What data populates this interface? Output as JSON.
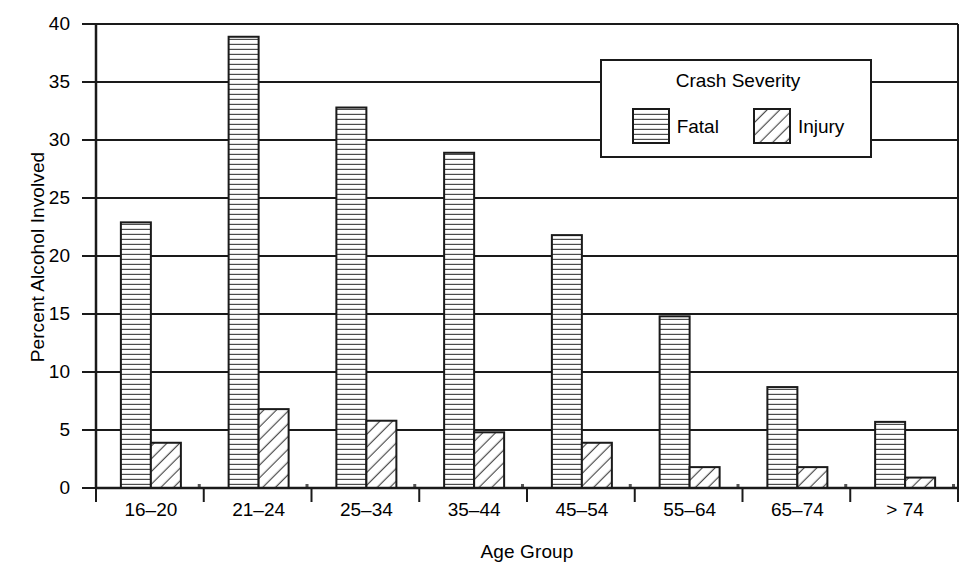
{
  "chart_data": {
    "type": "bar",
    "title": "",
    "xlabel": "Age Group",
    "ylabel": "Percent Alcohol Involved",
    "categories": [
      "16–20",
      "21–24",
      "25–34",
      "35–44",
      "45–54",
      "55–64",
      "65–74",
      "> 74"
    ],
    "series": [
      {
        "name": "Fatal",
        "values": [
          22.9,
          38.9,
          32.8,
          28.9,
          21.8,
          14.8,
          8.7,
          5.7
        ]
      },
      {
        "name": "Injury",
        "values": [
          3.9,
          6.8,
          5.8,
          4.8,
          3.9,
          1.8,
          1.8,
          0.9
        ]
      }
    ],
    "ylim": [
      0,
      40
    ],
    "yticks": [
      0,
      5,
      10,
      15,
      20,
      25,
      30,
      35,
      40
    ],
    "ytick_labels": [
      "0",
      "5",
      "10",
      "15",
      "20",
      "25",
      "30",
      "35",
      "40"
    ],
    "grid": true,
    "grid_axis": "y",
    "legend": {
      "title": "Crash Severity",
      "position": "upper-right-inside",
      "entries": [
        {
          "label": "Fatal",
          "pattern": "horizontal-lines"
        },
        {
          "label": "Injury",
          "pattern": "diagonal-hatch"
        }
      ]
    },
    "colors": {
      "axis": "#1a1a1a",
      "grid": "#1a1a1a",
      "bar_fill": "#ffffff",
      "bar_edge": "#1a1a1a",
      "pattern": "#4d4d4d",
      "background": "#ffffff"
    }
  }
}
